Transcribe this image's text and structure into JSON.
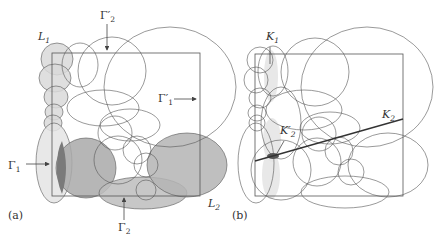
{
  "figure": {
    "panels": [
      {
        "id": "a",
        "caption": "(a)",
        "caption_pos": [
          8,
          219
        ],
        "rect": {
          "x": 52,
          "y": 53,
          "w": 148,
          "h": 143
        },
        "shapes": [
          {
            "kind": "ellipse",
            "cx": 57,
            "cy": 59,
            "rx": 16,
            "ry": 16,
            "fill": "#d9d9d9"
          },
          {
            "kind": "ellipse",
            "cx": 55,
            "cy": 78,
            "rx": 16,
            "ry": 14,
            "fill": "#d9d9d9"
          },
          {
            "kind": "ellipse",
            "cx": 56,
            "cy": 97,
            "rx": 12,
            "ry": 11,
            "fill": "#d9d9d9"
          },
          {
            "kind": "ellipse",
            "cx": 54,
            "cy": 112,
            "rx": 9,
            "ry": 8,
            "fill": "#d9d9d9"
          },
          {
            "kind": "ellipse",
            "cx": 53,
            "cy": 123,
            "rx": 9,
            "ry": 8,
            "fill": "#d9d9d9"
          },
          {
            "kind": "ellipse",
            "cx": 54,
            "cy": 163,
            "rx": 18,
            "ry": 40,
            "fill": "#e4e4e4"
          },
          {
            "kind": "ellipse",
            "cx": 86,
            "cy": 168,
            "rx": 30,
            "ry": 30,
            "fill": "#a9a9a9"
          },
          {
            "kind": "ellipse",
            "cx": 143,
            "cy": 193,
            "rx": 44,
            "ry": 16,
            "fill": "#bdbdbd"
          },
          {
            "kind": "ellipse",
            "cx": 187,
            "cy": 165,
            "rx": 40,
            "ry": 32,
            "fill": "#b4b4b4"
          },
          {
            "kind": "ellipse",
            "cx": 80,
            "cy": 65,
            "rx": 18,
            "ry": 22,
            "fill": "none"
          },
          {
            "kind": "ellipse",
            "cx": 112,
            "cy": 71,
            "rx": 34,
            "ry": 34,
            "fill": "none"
          },
          {
            "kind": "ellipse",
            "cx": 103,
            "cy": 108,
            "rx": 36,
            "ry": 18,
            "fill": "none"
          },
          {
            "kind": "ellipse",
            "cx": 170,
            "cy": 87,
            "rx": 66,
            "ry": 60,
            "fill": "none"
          },
          {
            "kind": "ellipse",
            "cx": 115,
            "cy": 133,
            "rx": 17,
            "ry": 17,
            "fill": "none"
          },
          {
            "kind": "ellipse",
            "cx": 130,
            "cy": 125,
            "rx": 30,
            "ry": 16,
            "fill": "none"
          },
          {
            "kind": "ellipse",
            "cx": 118,
            "cy": 160,
            "rx": 24,
            "ry": 24,
            "fill": "none"
          },
          {
            "kind": "ellipse",
            "cx": 137,
            "cy": 150,
            "rx": 14,
            "ry": 14,
            "fill": "none"
          },
          {
            "kind": "ellipse",
            "cx": 146,
            "cy": 165,
            "rx": 12,
            "ry": 12,
            "fill": "none"
          },
          {
            "kind": "ellipse",
            "cx": 146,
            "cy": 190,
            "rx": 10,
            "ry": 10,
            "fill": "none"
          }
        ],
        "labels": [
          {
            "id": "L1",
            "text": "L",
            "sub": "1",
            "x": 38,
            "y": 40
          },
          {
            "id": "Gamma2p",
            "text": "Γ′",
            "sub": "2",
            "x": 100,
            "y": 19
          },
          {
            "id": "Gamma1p",
            "text": "Γ′",
            "sub": "1",
            "x": 158,
            "y": 102
          },
          {
            "id": "Gamma1",
            "text": "Γ",
            "sub": "1",
            "x": 8,
            "y": 169
          },
          {
            "id": "Gamma2",
            "text": "Γ",
            "sub": "2",
            "x": 118,
            "y": 231
          },
          {
            "id": "L2",
            "text": "L",
            "sub": "2",
            "x": 208,
            "y": 207
          }
        ],
        "arrows": [
          {
            "id": "arrow-gamma2p",
            "x1": 107,
            "y1": 24,
            "x2": 107,
            "y2": 50
          },
          {
            "id": "arrow-gamma1p",
            "x1": 174,
            "y1": 99,
            "x2": 196,
            "y2": 99
          },
          {
            "id": "arrow-gamma1",
            "x1": 26,
            "y1": 164,
            "x2": 49,
            "y2": 164
          },
          {
            "id": "arrow-gamma2",
            "x1": 124,
            "y1": 220,
            "x2": 124,
            "y2": 198
          }
        ]
      },
      {
        "id": "b",
        "caption": "(b)",
        "caption_pos": [
          232,
          219
        ],
        "rect": {
          "x": 255,
          "y": 54,
          "w": 148,
          "h": 142
        },
        "shapes": [
          {
            "kind": "ellipse",
            "cx": 271,
            "cy": 76,
            "rx": 7,
            "ry": 26,
            "fill": "#e4e4e4",
            "stroke": "none"
          },
          {
            "kind": "ellipse",
            "cx": 272,
            "cy": 140,
            "rx": 9,
            "ry": 22,
            "fill": "#e4e4e4",
            "stroke": "none"
          },
          {
            "kind": "ellipse",
            "cx": 271,
            "cy": 175,
            "rx": 9,
            "ry": 24,
            "fill": "#e4e4e4",
            "stroke": "none"
          },
          {
            "kind": "ellipse",
            "cx": 260,
            "cy": 60,
            "rx": 13,
            "ry": 13,
            "fill": "none"
          },
          {
            "kind": "ellipse",
            "cx": 273,
            "cy": 71,
            "rx": 15,
            "ry": 25,
            "fill": "none"
          },
          {
            "kind": "ellipse",
            "cx": 256,
            "cy": 80,
            "rx": 12,
            "ry": 13,
            "fill": "none"
          },
          {
            "kind": "ellipse",
            "cx": 260,
            "cy": 98,
            "rx": 11,
            "ry": 10,
            "fill": "none"
          },
          {
            "kind": "ellipse",
            "cx": 257,
            "cy": 113,
            "rx": 9,
            "ry": 8,
            "fill": "none"
          },
          {
            "kind": "ellipse",
            "cx": 257,
            "cy": 123,
            "rx": 8,
            "ry": 8,
            "fill": "none"
          },
          {
            "kind": "ellipse",
            "cx": 256,
            "cy": 163,
            "rx": 18,
            "ry": 40,
            "fill": "none"
          },
          {
            "kind": "ellipse",
            "cx": 281,
            "cy": 170,
            "rx": 30,
            "ry": 30,
            "fill": "none"
          },
          {
            "kind": "ellipse",
            "cx": 281,
            "cy": 123,
            "rx": 20,
            "ry": 36,
            "fill": "none"
          },
          {
            "kind": "ellipse",
            "cx": 315,
            "cy": 72,
            "rx": 34,
            "ry": 34,
            "fill": "none"
          },
          {
            "kind": "ellipse",
            "cx": 304,
            "cy": 110,
            "rx": 38,
            "ry": 20,
            "fill": "none"
          },
          {
            "kind": "ellipse",
            "cx": 367,
            "cy": 87,
            "rx": 66,
            "ry": 60,
            "fill": "none"
          },
          {
            "kind": "ellipse",
            "cx": 319,
            "cy": 134,
            "rx": 17,
            "ry": 17,
            "fill": "none"
          },
          {
            "kind": "ellipse",
            "cx": 330,
            "cy": 128,
            "rx": 30,
            "ry": 16,
            "fill": "none"
          },
          {
            "kind": "ellipse",
            "cx": 317,
            "cy": 162,
            "rx": 24,
            "ry": 24,
            "fill": "none"
          },
          {
            "kind": "ellipse",
            "cx": 339,
            "cy": 151,
            "rx": 14,
            "ry": 14,
            "fill": "none"
          },
          {
            "kind": "ellipse",
            "cx": 351,
            "cy": 172,
            "rx": 13,
            "ry": 13,
            "fill": "none"
          },
          {
            "kind": "ellipse",
            "cx": 345,
            "cy": 192,
            "rx": 44,
            "ry": 16,
            "fill": "none"
          },
          {
            "kind": "ellipse",
            "cx": 388,
            "cy": 165,
            "rx": 40,
            "ry": 32,
            "fill": "none"
          }
        ],
        "labels": [
          {
            "id": "K1",
            "text": "K",
            "sub": "1",
            "x": 266,
            "y": 40
          },
          {
            "id": "K2",
            "text": "K",
            "sub": "2",
            "x": 382,
            "y": 118
          },
          {
            "id": "K2p",
            "text": "K′",
            "sub": "2",
            "x": 280,
            "y": 134
          }
        ],
        "lines": [
          {
            "id": "line-k2",
            "x1": 255,
            "y1": 161,
            "x2": 403,
            "y2": 119,
            "width": 1.3
          },
          {
            "id": "pointer-k1",
            "x1": 270,
            "y1": 47,
            "x2": 270,
            "y2": 64,
            "width": 0.7
          },
          {
            "id": "pointer-k2p",
            "x1": 284,
            "y1": 141,
            "x2": 276,
            "y2": 155,
            "width": 0.7
          }
        ],
        "dark_patch": {
          "cx": 273,
          "cy": 156,
          "rx": 6,
          "ry": 3,
          "fill": "#555555"
        }
      }
    ],
    "colors": {
      "stroke": "#555555",
      "text": "#333333",
      "background": "#ffffff"
    }
  }
}
